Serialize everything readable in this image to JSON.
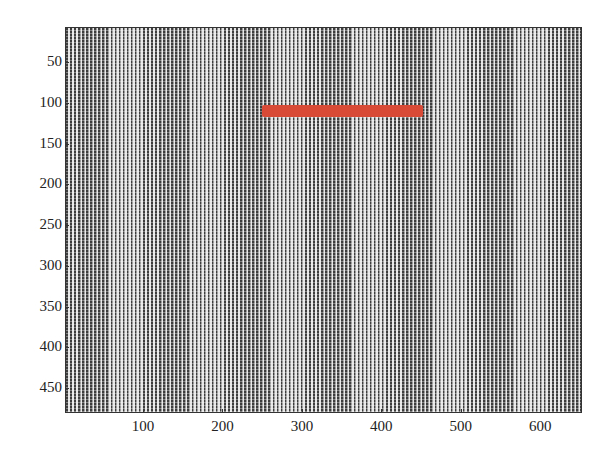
{
  "chart_data": {
    "type": "heatmap",
    "title": "",
    "xlabel": "",
    "ylabel": "",
    "xlim": [
      0.5,
      650
    ],
    "ylim": [
      480,
      0.5
    ],
    "y_reversed": true,
    "grid": false,
    "x_ticks": [
      100,
      200,
      300,
      400,
      500,
      600
    ],
    "y_ticks": [
      50,
      100,
      150,
      200,
      250,
      300,
      350,
      400,
      450
    ],
    "background_pattern": {
      "orientation": "vertical stripes",
      "period_px": 5,
      "colors": [
        "#3d3d3d",
        "#e6e6e6"
      ]
    },
    "annotations": [
      {
        "type": "horizontal-bar",
        "color": "#d94a36",
        "x_start": 250,
        "x_end": 452,
        "y_center": 110,
        "thickness": 14
      }
    ]
  },
  "axes": {
    "x_tick_labels": [
      "100",
      "200",
      "300",
      "400",
      "500",
      "600"
    ],
    "y_tick_labels": [
      "50",
      "100",
      "150",
      "200",
      "250",
      "300",
      "350",
      "400",
      "450"
    ]
  },
  "colors": {
    "bar": "#d94a36",
    "stripe_dark": "#3d3d3d",
    "stripe_light": "#e6e6e6"
  }
}
